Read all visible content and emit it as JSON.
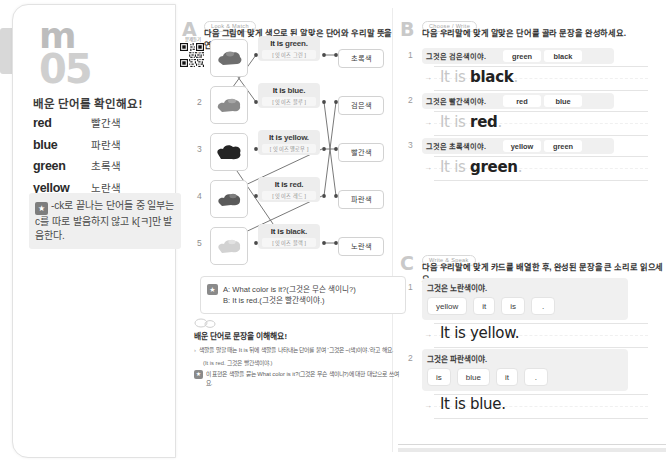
{
  "unit": {
    "logo_mark": "m",
    "unit_number": "05",
    "words_title": "배운 단어를 확인해요!",
    "words": [
      {
        "en": "red",
        "ko": "빨간색",
        "starred": false
      },
      {
        "en": "blue",
        "ko": "파란색",
        "starred": false
      },
      {
        "en": "green",
        "ko": "초록색",
        "starred": false
      },
      {
        "en": "yellow",
        "ko": "노란색",
        "starred": false
      },
      {
        "en": "black",
        "ko": "검은색",
        "starred": true
      }
    ],
    "tip_icon": "star-icon",
    "tip_text": "-ck로 끝나는 단어들 중 일부는 c를 따로 발음하지 않고 k[ㅋ]만 발음한다."
  },
  "qr": {
    "caption": "문제듣기",
    "name": "qr-code"
  },
  "section_a": {
    "letter": "A",
    "badge": "Look & Match",
    "instruction": "다음 그림에 맞게 색으로 된 알맞은 단어와 우리말 뜻을 연결하세요.",
    "pictures": [
      {
        "num": "1",
        "color": "#6e6e6e",
        "alt": "paint-splash-gray"
      },
      {
        "num": "2",
        "color": "#8a8a8a",
        "alt": "paint-splash-light"
      },
      {
        "num": "3",
        "color": "#2a2a2a",
        "alt": "paint-splash-black"
      },
      {
        "num": "4",
        "color": "#5a5a5a",
        "alt": "paint-splash-mid"
      },
      {
        "num": "5",
        "color": "#cfcfcf",
        "alt": "paint-splash-pale"
      }
    ],
    "cards": [
      {
        "pre": "It is ",
        "word": "green.",
        "ko": "[ 잇 이즈 그린 ]"
      },
      {
        "pre": "It is ",
        "word": "blue.",
        "ko": "[ 잇 이즈 블루 ]"
      },
      {
        "pre": "It is ",
        "word": "yellow.",
        "ko": "[ 잇 이즈 옐로우 ]"
      },
      {
        "pre": "It is ",
        "word": "red.",
        "ko": "[ 잇 이즈 레드 ]"
      },
      {
        "pre": "It is ",
        "word": "black.",
        "ko": "[ 잇 이즈 블랙 ]"
      }
    ],
    "ko_labels": [
      "초록색",
      "검은색",
      "빨간색",
      "파란색",
      "노란색"
    ]
  },
  "dialog": {
    "icon": "star-icon",
    "line_a": "A: What color is it?(그것은 무슨 색이니?)",
    "line_b": "B: It is red.(그것은 빨간색이야.)"
  },
  "explain": {
    "icon": "speech-bubble-icon",
    "heading": "배운 단어로 문장을 이해해요!",
    "line1": "색깔을 말할 때는 It is 뒤에 색깔을 나타내는 단어를 붙여 '그것은 ~(색)이야.'라고 해요.",
    "line1_ex": "(It is red. 그것은 빨간색이야.)",
    "star_icon": "star-icon",
    "line2": "이 표현은 색깔을 묻는 What color is it?(그것은 무슨 색이니?)에 대한 대답으로 쓰여요."
  },
  "section_b": {
    "letter": "B",
    "badge": "Choose / Write",
    "instruction": "다음 우리말에 맞게 알맞은 단어를 골라 문장을 완성하세요.",
    "items": [
      {
        "num": "1",
        "ko": "그것은 검은색이야.",
        "choices": [
          "green",
          "black"
        ],
        "answer_pre": "It is ",
        "answer_word": "black",
        "answer_dot": "."
      },
      {
        "num": "2",
        "ko": "그것은 빨간색이야.",
        "choices": [
          "red",
          "blue"
        ],
        "answer_pre": "It is ",
        "answer_word": "red",
        "answer_dot": "."
      },
      {
        "num": "3",
        "ko": "그것은 초록색이야.",
        "choices": [
          "yellow",
          "green"
        ],
        "answer_pre": "It is ",
        "answer_word": "green",
        "answer_dot": "."
      }
    ]
  },
  "section_c": {
    "letter": "C",
    "badge": "Write & Speak",
    "instruction": "다음 우리말에 맞게 카드를 배열한 후, 완성된 문장을 큰 소리로 읽으세요.",
    "items": [
      {
        "num": "1",
        "ko": "그것은 노란색이야.",
        "cards": [
          "yellow",
          "it",
          "is",
          "."
        ],
        "answer": "It is yellow."
      },
      {
        "num": "2",
        "ko": "그것은 파란색이야.",
        "cards": [
          "is",
          "blue",
          "it",
          "."
        ],
        "answer": "It is blue."
      }
    ]
  }
}
